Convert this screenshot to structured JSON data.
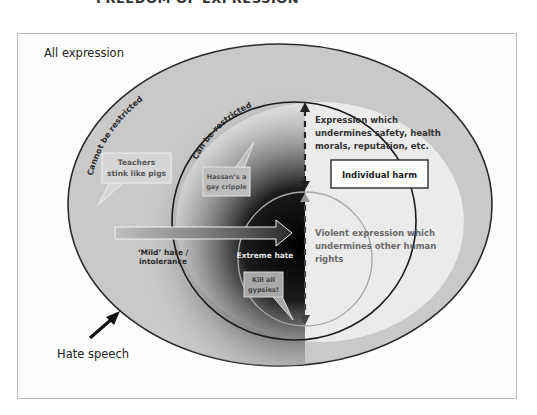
{
  "title": "FREEDOM OF EXPRESSION",
  "labels": {
    "all_expression": "All expression",
    "hate_speech": "Hate speech",
    "cannot_be_restricted": "Cannot be restricted",
    "can_be_restricted": "Can be restricted",
    "mild_hate_line1": "‘Mild’ hate /",
    "mild_hate_line2": "intolerance",
    "extreme_hate": "Extreme hate",
    "individual_harm": "Individual harm",
    "undermines_line1": "Expression which",
    "undermines_line2": "undermines safety, health",
    "undermines_line3": "morals, reputation, etc.",
    "violent_line1": "Violent expression which",
    "violent_line2": "undermines other human",
    "violent_line3": "rights"
  },
  "bubbles": [
    {
      "line1": "Teachers",
      "line2": "stink like pigs"
    },
    {
      "line1": "Hassan’s a",
      "line2": "gay cripple"
    },
    {
      "line1": "Kill all",
      "line2": "gypsies!"
    }
  ],
  "colors": {
    "outer_fill": "#c9c9c9",
    "light_fill": "#ebebeb",
    "dark_gradient": "#141414",
    "stroke": "#222222",
    "bubble_fill": "#d6d6d6",
    "text_dark": "#2b2b2b",
    "text_grey": "#666666"
  }
}
